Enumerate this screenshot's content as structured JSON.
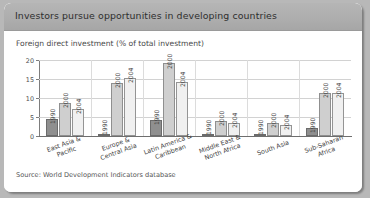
{
  "figure": {
    "title": "Investors pursue opportunities in developing countries",
    "subtitle": "Foreign direct investment (% of total investment)",
    "source": "Source: World Development Indicators database"
  },
  "colors": {
    "title_bar": "#aeaeae",
    "panel": "#ffffff",
    "series_1990": "#8f8f8f",
    "series_2000": "#cfcfcf",
    "series_2004": "#f0f0f0",
    "gridline": "#d2d2d2",
    "axis": "#6e6e6e"
  },
  "chart_data": {
    "type": "bar",
    "title": "Investors pursue opportunities in developing countries",
    "subtitle": "Foreign direct investment (% of total investment)",
    "xlabel": "",
    "ylabel": "",
    "ylim": [
      0,
      20
    ],
    "yticks": [
      0,
      5,
      10,
      15,
      20
    ],
    "ytick_labels": [
      "0",
      "5",
      "10",
      "15",
      "20"
    ],
    "grid": true,
    "legend": "none (bars labelled in-place with year)",
    "categories": [
      "East Asia & Pacific",
      "Europe & Central Asia",
      "Latin America & Caribbean",
      "Middle East & North Africa",
      "South Asia",
      "Sub-Saharan Africa"
    ],
    "category_lines": [
      [
        "East Asia &",
        "Pacific"
      ],
      [
        "Europe &",
        "Central Asia"
      ],
      [
        "Latin America &",
        "Caribbean"
      ],
      [
        "Middle East &",
        "North Africa"
      ],
      [
        "South Asia"
      ],
      [
        "Sub-Saharan",
        "Africa"
      ]
    ],
    "series": [
      {
        "name": "1990",
        "values": [
          4.5,
          0.3,
          4.1,
          0.1,
          0.3,
          2.0
        ]
      },
      {
        "name": "2000",
        "values": [
          8.8,
          14.0,
          19.2,
          3.9,
          3.3,
          11.2
        ]
      },
      {
        "name": "2004",
        "values": [
          7.1,
          15.2,
          14.3,
          3.5,
          3.0,
          11.3
        ]
      }
    ],
    "bar_labels": [
      "1990",
      "2000",
      "2004"
    ]
  }
}
